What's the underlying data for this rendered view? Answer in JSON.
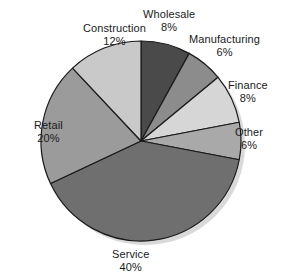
{
  "chart_data": {
    "type": "pie",
    "title": "",
    "subtitle": "",
    "xlabel": "",
    "ylabel": "",
    "legend_position": "none",
    "grid": false,
    "labels_show_percent": true,
    "start_angle_deg": 0,
    "direction": "clockwise",
    "categories": [
      "Wholesale",
      "Manufacturing",
      "Finance",
      "Other",
      "Service",
      "Retail",
      "Construction"
    ],
    "values": [
      8,
      6,
      8,
      6,
      40,
      20,
      12
    ],
    "unit": "%",
    "total": 100,
    "slices": [
      {
        "label": "Wholesale",
        "value": 8,
        "value_text": "8%",
        "color": "#4a4a4a"
      },
      {
        "label": "Manufacturing",
        "value": 6,
        "value_text": "6%",
        "color": "#8c8c8c"
      },
      {
        "label": "Finance",
        "value": 8,
        "value_text": "8%",
        "color": "#d6d6d6"
      },
      {
        "label": "Other",
        "value": 6,
        "value_text": "6%",
        "color": "#a9a9a9"
      },
      {
        "label": "Service",
        "value": 40,
        "value_text": "40%",
        "color": "#6f6f6f"
      },
      {
        "label": "Retail",
        "value": 20,
        "value_text": "20%",
        "color": "#9b9b9b"
      },
      {
        "label": "Construction",
        "value": 12,
        "value_text": "12%",
        "color": "#c9c9c9"
      }
    ]
  },
  "geometry": {
    "center_x": 141,
    "center_y": 141,
    "radius": 100
  },
  "style": {
    "background": "#ffffff",
    "outline_color": "#1a1a1a",
    "text_color": "#1a1a1a",
    "shadow_color": "#d9d9d9"
  },
  "labels": {
    "wholesale": {
      "name": "Wholesale",
      "value": "8%"
    },
    "manufacturing": {
      "name": "Manufacturing",
      "value": "6%"
    },
    "finance": {
      "name": "Finance",
      "value": "8%"
    },
    "other": {
      "name": "Other",
      "value": "6%"
    },
    "service": {
      "name": "Service",
      "value": "40%"
    },
    "retail": {
      "name": "Retail",
      "value": "20%"
    },
    "construction": {
      "name": "Construction",
      "value": "12%"
    }
  }
}
